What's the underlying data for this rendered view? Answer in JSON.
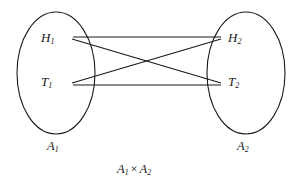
{
  "figure": {
    "background_color": "#ffffff",
    "stroke_color": "#1a1a1a",
    "text_color": "#1a1a1a"
  },
  "sets": [
    {
      "id": "A1",
      "label_base": "A",
      "label_sub": "1",
      "cx": 56,
      "cy": 73,
      "rx": 39,
      "ry": 61,
      "label_x": 47,
      "label_y": 140
    },
    {
      "id": "A2",
      "label_base": "A",
      "label_sub": "2",
      "cx": 246,
      "cy": 73,
      "rx": 39,
      "ry": 61,
      "label_x": 237,
      "label_y": 140
    }
  ],
  "nodes": [
    {
      "id": "H1",
      "base": "H",
      "sub": "1",
      "x": 41,
      "y": 31,
      "anchor_x": 73,
      "anchor_y": 38
    },
    {
      "id": "T1",
      "base": "T",
      "sub": "1",
      "x": 41,
      "y": 75,
      "anchor_x": 73,
      "anchor_y": 82
    },
    {
      "id": "H2",
      "base": "H",
      "sub": "2",
      "x": 228,
      "y": 31,
      "anchor_x": 222,
      "anchor_y": 38
    },
    {
      "id": "T2",
      "base": "T",
      "sub": "2",
      "x": 228,
      "y": 75,
      "anchor_x": 222,
      "anchor_y": 82
    }
  ],
  "edges": [
    {
      "id": "H1-H2",
      "from": "H1",
      "to": "H2",
      "x1": 73,
      "y1": 37,
      "x2": 221,
      "y2": 37
    },
    {
      "id": "H1-T2",
      "from": "H1",
      "to": "T2",
      "x1": 72,
      "y1": 39,
      "x2": 221,
      "y2": 83
    },
    {
      "id": "T1-H2",
      "from": "T1",
      "to": "H2",
      "x1": 72,
      "y1": 83,
      "x2": 221,
      "y2": 39
    },
    {
      "id": "T1-T2",
      "from": "T1",
      "to": "T2",
      "x1": 73,
      "y1": 85,
      "x2": 221,
      "y2": 85
    }
  ],
  "caption": {
    "left_base": "A",
    "left_sub": "1",
    "operator": "×",
    "right_base": "A",
    "right_sub": "2",
    "x": 117,
    "y": 163
  }
}
